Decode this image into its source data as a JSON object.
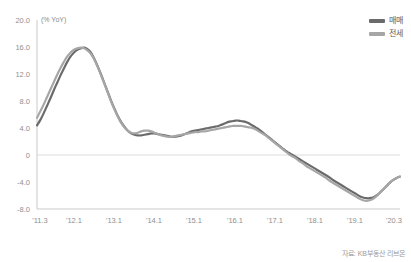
{
  "chart_data": {
    "type": "line",
    "title": "",
    "subtitle": "",
    "unit_label": "(% YoY)",
    "xlabel": "",
    "ylabel": "",
    "ylim": [
      -8.0,
      20.0
    ],
    "grid": false,
    "zero_line": true,
    "legend_position": "top-right",
    "y_ticks": [
      "20.0",
      "16.0",
      "12.0",
      "8.0",
      "4.0",
      "0",
      "-4.0",
      "-8.0"
    ],
    "y_tick_values": [
      20.0,
      16.0,
      12.0,
      8.0,
      4.0,
      0,
      -4.0,
      -8.0
    ],
    "x_ticks": [
      "'11.3",
      "'12.1",
      "'13.1",
      "'14.1",
      "'15.1",
      "'16.1",
      "'17.1",
      "'18.1",
      "'19.1",
      "'20.3"
    ],
    "x_tick_values": [
      0,
      10,
      22,
      34,
      46,
      58,
      70,
      82,
      94,
      108
    ],
    "x_range": [
      0,
      108
    ],
    "series": [
      {
        "name": "매매",
        "color": "#6b6b6b",
        "values": [
          4.4,
          5.2,
          6.2,
          7.3,
          8.4,
          9.6,
          10.7,
          11.8,
          12.8,
          13.8,
          14.6,
          15.2,
          15.6,
          15.8,
          15.9,
          15.7,
          15.2,
          14.3,
          13.2,
          12.0,
          10.7,
          9.4,
          8.1,
          6.9,
          5.8,
          4.9,
          4.2,
          3.6,
          3.2,
          3.0,
          2.9,
          2.9,
          3.0,
          3.1,
          3.2,
          3.2,
          3.1,
          3.0,
          2.9,
          2.8,
          2.7,
          2.7,
          2.8,
          2.9,
          3.1,
          3.3,
          3.5,
          3.6,
          3.7,
          3.8,
          3.9,
          4.0,
          4.1,
          4.2,
          4.3,
          4.5,
          4.7,
          4.9,
          5.0,
          5.1,
          5.1,
          5.0,
          4.9,
          4.7,
          4.4,
          4.1,
          3.8,
          3.4,
          3.0,
          2.6,
          2.2,
          1.8,
          1.4,
          1.0,
          0.6,
          0.3,
          0.0,
          -0.3,
          -0.6,
          -0.9,
          -1.2,
          -1.5,
          -1.8,
          -2.1,
          -2.4,
          -2.7,
          -3.0,
          -3.3,
          -3.7,
          -4.0,
          -4.3,
          -4.6,
          -4.9,
          -5.2,
          -5.5,
          -5.8,
          -6.1,
          -6.3,
          -6.4,
          -6.4,
          -6.3,
          -6.0,
          -5.6,
          -5.1,
          -4.6,
          -4.1,
          -3.7,
          -3.4,
          -3.2
        ]
      },
      {
        "name": "전세",
        "color": "#a6a6a6",
        "values": [
          5.5,
          6.5,
          7.5,
          8.6,
          9.7,
          10.8,
          11.9,
          12.9,
          13.8,
          14.6,
          15.2,
          15.6,
          15.8,
          15.9,
          15.8,
          15.5,
          15.0,
          14.2,
          13.1,
          11.9,
          10.6,
          9.3,
          8.0,
          6.8,
          5.7,
          4.8,
          4.1,
          3.6,
          3.3,
          3.2,
          3.3,
          3.5,
          3.6,
          3.6,
          3.5,
          3.3,
          3.1,
          2.9,
          2.8,
          2.7,
          2.7,
          2.8,
          2.9,
          3.0,
          3.1,
          3.2,
          3.3,
          3.4,
          3.4,
          3.5,
          3.5,
          3.6,
          3.7,
          3.8,
          3.9,
          4.0,
          4.1,
          4.2,
          4.3,
          4.3,
          4.3,
          4.3,
          4.2,
          4.1,
          4.0,
          3.8,
          3.5,
          3.2,
          2.9,
          2.5,
          2.1,
          1.7,
          1.3,
          0.9,
          0.5,
          0.1,
          -0.2,
          -0.5,
          -0.9,
          -1.2,
          -1.6,
          -1.9,
          -2.2,
          -2.5,
          -2.8,
          -3.1,
          -3.4,
          -3.8,
          -4.1,
          -4.4,
          -4.7,
          -5.0,
          -5.3,
          -5.6,
          -5.9,
          -6.2,
          -6.5,
          -6.7,
          -6.8,
          -6.7,
          -6.5,
          -6.1,
          -5.6,
          -5.1,
          -4.6,
          -4.1,
          -3.7,
          -3.4,
          -3.2
        ]
      }
    ],
    "source_note": "자료: KB부동산 리브온"
  },
  "legend": {
    "items": [
      {
        "label": "매매",
        "color": "#6b6b6b"
      },
      {
        "label": "전세",
        "color": "#a6a6a6"
      }
    ]
  },
  "footer": {
    "source": "자료: KB부동산 리브온"
  },
  "colors": {
    "maemae": "#6b6b6b",
    "jeonse": "#a6a6a6",
    "axis": "#c9c9c9",
    "tick_text": "#8f8f8f",
    "zero_line": "#d8d8d8"
  }
}
